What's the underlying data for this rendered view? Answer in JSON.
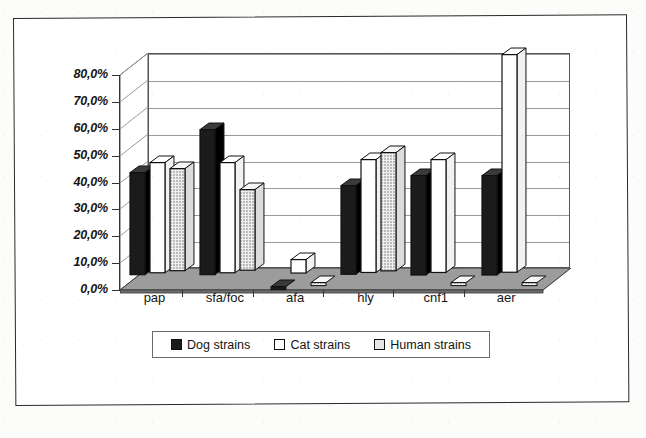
{
  "chart_data": {
    "type": "bar",
    "title": "",
    "subtitle": "",
    "xlabel": "",
    "ylabel": "",
    "categories": [
      "pap",
      "sfa/foc",
      "afa",
      "hly",
      "cnf1",
      "aer"
    ],
    "series": [
      {
        "name": "Dog strains",
        "values": [
          38,
          54,
          0,
          33,
          37,
          37
        ],
        "color": "#1b1b1b"
      },
      {
        "name": "Cat strains",
        "values": [
          41,
          41,
          5,
          42,
          42,
          81
        ],
        "color": "#ffffff"
      },
      {
        "name": "Human strains",
        "values": [
          38,
          30,
          0,
          44,
          1,
          1
        ],
        "color": "#e6e6e6"
      }
    ],
    "ylim": [
      0,
      80
    ],
    "ytick_values": [
      0,
      10,
      20,
      30,
      40,
      50,
      60,
      70,
      80
    ],
    "ytick_labels": [
      "0,0%",
      "10,0%",
      "20,0%",
      "30,0%",
      "40,0%",
      "50,0%",
      "60,0%",
      "70,0%",
      "80,0%"
    ],
    "grid": true,
    "legend_position": "bottom",
    "style_3d": true,
    "value_unit": "percent",
    "decimal_separator": ","
  },
  "legend": {
    "items": [
      {
        "label": "Dog strains",
        "swatch": "legend-swatch-dog"
      },
      {
        "label": "Cat strains",
        "swatch": "legend-swatch-cat"
      },
      {
        "label": "Human strains",
        "swatch": "legend-swatch-human"
      }
    ]
  },
  "colors": {
    "dog": "#1b1b1b",
    "cat": "#ffffff",
    "human": "#e6e6e6",
    "outline": "#111111",
    "gridline": "#9a9a9a",
    "floor": "#8e8e8e",
    "frame": "#2a2a2a"
  }
}
